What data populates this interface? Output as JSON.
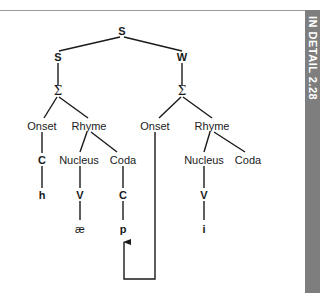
{
  "sidebar": {
    "label": "IN DETAIL 2.28",
    "color": "#7e7e7e"
  },
  "tree": {
    "root": "S",
    "feet": [
      {
        "label": "S",
        "syllable": "Σ",
        "onset": {
          "label": "Onset",
          "segment": "C",
          "phone": "h"
        },
        "rhyme": {
          "label": "Rhyme",
          "nucleus": {
            "label": "Nucleus",
            "segment": "V",
            "phone": "æ"
          },
          "coda": {
            "label": "Coda",
            "segment": "C",
            "phone": "p"
          }
        }
      },
      {
        "label": "W",
        "syllable": "Σ",
        "onset": {
          "label": "Onset"
        },
        "rhyme": {
          "label": "Rhyme",
          "nucleus": {
            "label": "Nucleus",
            "segment": "V",
            "phone": "i"
          },
          "coda": {
            "label": "Coda"
          }
        }
      }
    ],
    "ambisyllabic_link": "Onset of second syllable linked to coda consonant p"
  }
}
